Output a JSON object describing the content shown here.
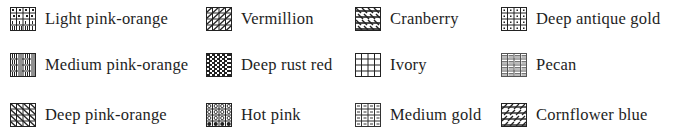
{
  "legend": {
    "items": [
      {
        "label": "Light pink-orange",
        "pattern": "brick-dots",
        "col": 0,
        "row": 0
      },
      {
        "label": "Vermillion",
        "pattern": "diagonal-grid",
        "col": 1,
        "row": 0
      },
      {
        "label": "Cranberry",
        "pattern": "dense-diagonal-checker",
        "col": 2,
        "row": 0
      },
      {
        "label": "Deep antique gold",
        "pattern": "dotted-grid",
        "col": 3,
        "row": 0
      },
      {
        "label": "Medium pink-orange",
        "pattern": "vertical-bars-grid",
        "col": 0,
        "row": 1
      },
      {
        "label": "Deep rust red",
        "pattern": "dense-checker",
        "col": 1,
        "row": 1
      },
      {
        "label": "Ivory",
        "pattern": "plain-grid",
        "col": 2,
        "row": 1
      },
      {
        "label": "Pecan",
        "pattern": "horizontal-dash-grid",
        "col": 3,
        "row": 1
      },
      {
        "label": "Deep pink-orange",
        "pattern": "back-diagonal-grid",
        "col": 0,
        "row": 2
      },
      {
        "label": "Hot pink",
        "pattern": "circles-grid",
        "col": 1,
        "row": 2
      },
      {
        "label": "Medium gold",
        "pattern": "dash-grid",
        "col": 2,
        "row": 2
      },
      {
        "label": "Cornflower blue",
        "pattern": "diagonal-checker",
        "col": 3,
        "row": 2
      }
    ]
  }
}
